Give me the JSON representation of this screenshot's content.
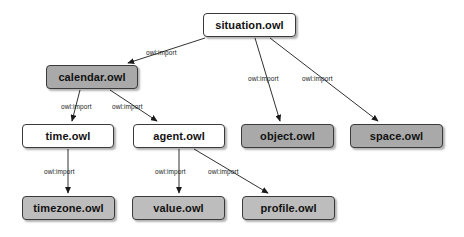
{
  "diagram": {
    "background_color": "#ffffff",
    "node_fill_white": "#ffffff",
    "node_fill_gray_dark": "#a9a9a9",
    "node_fill_gray_light": "#bdbdbd",
    "node_border_color": "#3a3a3a",
    "edge_color": "#1a1a1a",
    "nodes": [
      {
        "id": "situation",
        "label": "situation.owl",
        "style": "white",
        "x": 203,
        "y": 13,
        "w": 93,
        "h": 24
      },
      {
        "id": "calendar",
        "label": "calendar.owl",
        "style": "gray-dark",
        "x": 46,
        "y": 65,
        "w": 92,
        "h": 24
      },
      {
        "id": "time",
        "label": "time.owl",
        "style": "white",
        "x": 22,
        "y": 124,
        "w": 92,
        "h": 24
      },
      {
        "id": "agent",
        "label": "agent.owl",
        "style": "white",
        "x": 133,
        "y": 124,
        "w": 92,
        "h": 24
      },
      {
        "id": "object",
        "label": "object.owl",
        "style": "gray-dark",
        "x": 241,
        "y": 124,
        "w": 93,
        "h": 24
      },
      {
        "id": "space",
        "label": "space.owl",
        "style": "gray-dark",
        "x": 350,
        "y": 124,
        "w": 93,
        "h": 24
      },
      {
        "id": "timezone",
        "label": "timezone.owl",
        "style": "gray-light",
        "x": 22,
        "y": 196,
        "w": 93,
        "h": 24
      },
      {
        "id": "value",
        "label": "value.owl",
        "style": "gray-light",
        "x": 132,
        "y": 196,
        "w": 93,
        "h": 24
      },
      {
        "id": "profile",
        "label": "profile.owl",
        "style": "gray-light",
        "x": 242,
        "y": 196,
        "w": 93,
        "h": 24
      }
    ],
    "edges": [
      {
        "id": "situation-calendar",
        "from": "situation",
        "to": "calendar",
        "label": "owl:import",
        "label_x": 146,
        "label_y": 49,
        "x1": 205,
        "y1": 38,
        "x2": 128,
        "y2": 63
      },
      {
        "id": "situation-object",
        "from": "situation",
        "to": "object",
        "label": "owl:import",
        "label_x": 248,
        "label_y": 75,
        "x1": 255,
        "y1": 38,
        "x2": 280,
        "y2": 121
      },
      {
        "id": "situation-space",
        "from": "situation",
        "to": "space",
        "label": "owl:import",
        "label_x": 302,
        "label_y": 75,
        "x1": 270,
        "y1": 38,
        "x2": 378,
        "y2": 121
      },
      {
        "id": "calendar-time",
        "from": "calendar",
        "to": "time",
        "label": "owl:import",
        "label_x": 61,
        "label_y": 103,
        "x1": 80,
        "y1": 90,
        "x2": 72,
        "y2": 121
      },
      {
        "id": "calendar-agent",
        "from": "calendar",
        "to": "agent",
        "label": "owl:import",
        "label_x": 112,
        "label_y": 103,
        "x1": 110,
        "y1": 90,
        "x2": 157,
        "y2": 121
      },
      {
        "id": "time-timezone",
        "from": "time",
        "to": "timezone",
        "label": "owl:import",
        "label_x": 44,
        "label_y": 168,
        "x1": 68,
        "y1": 149,
        "x2": 68,
        "y2": 193
      },
      {
        "id": "agent-value",
        "from": "agent",
        "to": "value",
        "label": "owl:import",
        "label_x": 155,
        "label_y": 168,
        "x1": 179,
        "y1": 149,
        "x2": 179,
        "y2": 193
      },
      {
        "id": "agent-profile",
        "from": "agent",
        "to": "profile",
        "label": "owl:import",
        "label_x": 208,
        "label_y": 168,
        "x1": 194,
        "y1": 149,
        "x2": 268,
        "y2": 193
      }
    ]
  }
}
